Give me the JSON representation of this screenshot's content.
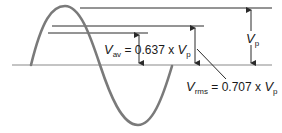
{
  "diagram": {
    "colors": {
      "wave": "#7a7a7a",
      "lines": "#2a2a2a",
      "baseline": "#8a8a8a",
      "text": "#1a1a1a"
    },
    "labels": {
      "vp": {
        "symbol": "V",
        "subscript": "p"
      },
      "vav": {
        "symbol": "V",
        "subscript": "av",
        "equals": "= 0.637 x",
        "ref_symbol": "V",
        "ref_subscript": "p"
      },
      "vrms": {
        "symbol": "V",
        "subscript": "rms",
        "equals": "= 0.707 x",
        "ref_symbol": "V",
        "ref_subscript": "p"
      }
    },
    "values": {
      "vav_factor": 0.637,
      "vrms_factor": 0.707
    }
  }
}
